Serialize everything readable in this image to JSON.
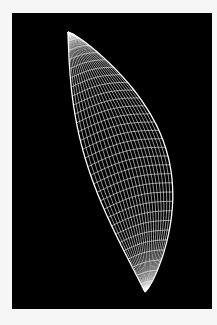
{
  "figure": {
    "background_color": "#f6f6f6",
    "panel_color": "#000000",
    "mesh_color": "#ffffff",
    "shape": {
      "top_tip": [
        68,
        32
      ],
      "bottom_tip": [
        145,
        292
      ],
      "u_lines": 30,
      "v_lines": 22
    }
  }
}
